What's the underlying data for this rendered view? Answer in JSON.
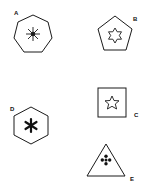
{
  "figure": {
    "stroke_color": "#1a1a1a",
    "background": "#ffffff",
    "shapes": [
      {
        "label": "A",
        "outer_shape": "heptagon",
        "inner_symbol": "eight-ray-asterisk"
      },
      {
        "label": "B",
        "outer_shape": "pentagon",
        "inner_symbol": "six-point-star-outline"
      },
      {
        "label": "C",
        "outer_shape": "square",
        "inner_symbol": "five-point-star-outline"
      },
      {
        "label": "D",
        "outer_shape": "hexagon",
        "inner_symbol": "six-ray-asterisk"
      },
      {
        "label": "E",
        "outer_shape": "triangle",
        "inner_symbol": "four-petal-cross"
      }
    ]
  }
}
